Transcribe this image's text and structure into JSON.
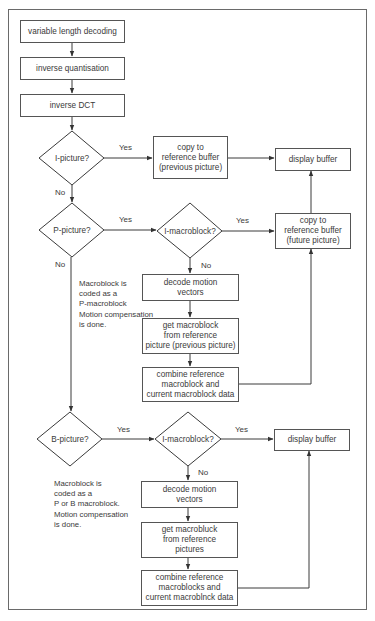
{
  "diagram": {
    "type": "flowchart",
    "title": "",
    "nodes": {
      "vld": {
        "label": "variable length decoding"
      },
      "iq": {
        "label": "inverse quantisation"
      },
      "idct": {
        "label": "inverse DCT"
      },
      "i_picture": {
        "label": "I-picture?"
      },
      "copy_prev": {
        "label": "copy to\nreference buffer\n(previous picture)"
      },
      "display1": {
        "label": "display buffer"
      },
      "p_picture": {
        "label": "P-picture?"
      },
      "i_mb1": {
        "label": "I-macroblock?"
      },
      "copy_future": {
        "label": "copy to\nreference buffer\n(future picture)"
      },
      "decode_mv1": {
        "label": "decode motion\nvectors"
      },
      "get_mb1": {
        "label": "get macroblock\nfrom reference\npicture (previous picture)"
      },
      "combine1": {
        "label": "combine reference\nmacroblock and\ncurrent macroblock data"
      },
      "b_picture": {
        "label": "B-picture?"
      },
      "i_mb2": {
        "label": "I-macroblock?"
      },
      "display2": {
        "label": "display buffer"
      },
      "decode_mv2": {
        "label": "decode motion\nvectors"
      },
      "get_mb2": {
        "label": "get macrobluck\nfrom reference\npictures"
      },
      "combine2": {
        "label": "combine reference\nmacroblocks and\ncurrent macroblnck data"
      }
    },
    "edge_labels": {
      "i_yes": "Yes",
      "i_no": "No",
      "p_yes": "Yes",
      "p_no": "No",
      "imb1_yes": "Yes",
      "imb1_no": "No",
      "b_yes": "Yes",
      "imb2_yes": "Yes",
      "imb2_no": "No"
    },
    "notes": {
      "p_note": "Macroblock is\ncoded as a\nP-macroblock\nMotion compensation\nis done.",
      "b_note": "Macroblock is\ncoded as a\nP or B macroblock.\nMotion compensation\nis done."
    },
    "edges": [
      {
        "from": "vld",
        "to": "iq"
      },
      {
        "from": "iq",
        "to": "idct"
      },
      {
        "from": "idct",
        "to": "i_picture"
      },
      {
        "from": "i_picture",
        "to": "copy_prev",
        "label": "Yes"
      },
      {
        "from": "copy_prev",
        "to": "display1"
      },
      {
        "from": "i_picture",
        "to": "p_picture",
        "label": "No"
      },
      {
        "from": "p_picture",
        "to": "i_mb1",
        "label": "Yes"
      },
      {
        "from": "i_mb1",
        "to": "copy_future",
        "label": "Yes"
      },
      {
        "from": "copy_future",
        "to": "display1"
      },
      {
        "from": "i_mb1",
        "to": "decode_mv1",
        "label": "No"
      },
      {
        "from": "decode_mv1",
        "to": "get_mb1"
      },
      {
        "from": "get_mb1",
        "to": "combine1"
      },
      {
        "from": "combine1",
        "to": "copy_future"
      },
      {
        "from": "p_picture",
        "to": "b_picture",
        "label": "No"
      },
      {
        "from": "b_picture",
        "to": "i_mb2",
        "label": "Yes"
      },
      {
        "from": "i_mb2",
        "to": "display2",
        "label": "Yes"
      },
      {
        "from": "i_mb2",
        "to": "decode_mv2",
        "label": "No"
      },
      {
        "from": "decode_mv2",
        "to": "get_mb2"
      },
      {
        "from": "get_mb2",
        "to": "combine2"
      },
      {
        "from": "combine2",
        "to": "display2"
      }
    ]
  }
}
